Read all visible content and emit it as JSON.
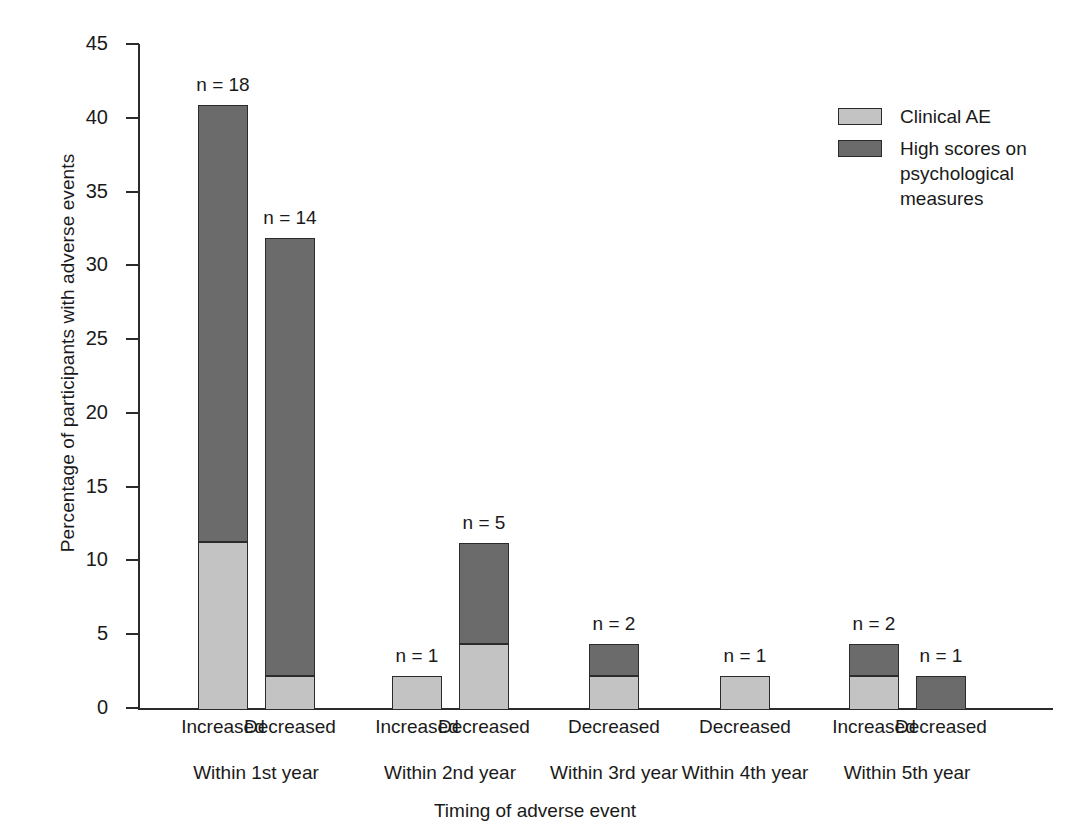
{
  "chart_data": {
    "type": "bar",
    "subtype": "stacked-bar",
    "title": "",
    "xlabel": "Timing of adverse event",
    "ylabel": "Percentage of participants with adverse events",
    "ylim": [
      0,
      45
    ],
    "yticks": [
      0,
      5,
      10,
      15,
      20,
      25,
      30,
      35,
      40,
      45
    ],
    "ytick_labels": [
      "0",
      "5",
      "10",
      "15",
      "20",
      "25",
      "30",
      "35",
      "40",
      "45"
    ],
    "grid": false,
    "legend_position": "top-right",
    "categories": [
      "Increased",
      "Decreased",
      "Increased",
      "Decreased",
      "Decreased",
      "Decreased",
      "Increased",
      "Decreased"
    ],
    "groups": [
      {
        "label": "Within 1st year",
        "categories": [
          "Increased",
          "Decreased"
        ]
      },
      {
        "label": "Within 2nd year",
        "categories": [
          "Increased",
          "Decreased"
        ]
      },
      {
        "label": "Within 3rd year",
        "categories": [
          "Decreased"
        ]
      },
      {
        "label": "Within 4th year",
        "categories": [
          "Decreased"
        ]
      },
      {
        "label": "Within 5th year",
        "categories": [
          "Increased",
          "Decreased"
        ]
      }
    ],
    "series": [
      {
        "name": "Clinical AE",
        "color": "#c3c3c3",
        "values": [
          11.4,
          2.3,
          2.3,
          4.5,
          2.3,
          2.3,
          2.3,
          0
        ]
      },
      {
        "name": "High scores on psychological measures",
        "color": "#6b6b6b",
        "values": [
          29.6,
          29.7,
          0,
          6.8,
          2.2,
          0,
          2.2,
          2.3
        ]
      }
    ],
    "totals": [
      41.0,
      32.0,
      2.3,
      11.3,
      4.5,
      2.3,
      4.5,
      2.3
    ],
    "point_labels": [
      "n = 18",
      "n = 14",
      "n = 1",
      "n = 5",
      "n = 2",
      "n = 1",
      "n = 2",
      "n = 1"
    ],
    "bars": [
      {
        "group": "Within 1st year",
        "category": "Increased",
        "label": "n = 18",
        "light": 11.4,
        "dark": 29.6,
        "total": 41.0
      },
      {
        "group": "Within 1st year",
        "category": "Decreased",
        "label": "n = 14",
        "light": 2.3,
        "dark": 29.7,
        "total": 32.0
      },
      {
        "group": "Within 2nd year",
        "category": "Increased",
        "label": "n = 1",
        "light": 2.3,
        "dark": 0.0,
        "total": 2.3
      },
      {
        "group": "Within 2nd year",
        "category": "Decreased",
        "label": "n = 5",
        "light": 4.5,
        "dark": 6.8,
        "total": 11.3
      },
      {
        "group": "Within 3rd year",
        "category": "Decreased",
        "label": "n = 2",
        "light": 2.3,
        "dark": 2.2,
        "total": 4.5
      },
      {
        "group": "Within 4th year",
        "category": "Decreased",
        "label": "n = 1",
        "light": 2.3,
        "dark": 0.0,
        "total": 2.3
      },
      {
        "group": "Within 5th year",
        "category": "Increased",
        "label": "n = 2",
        "light": 2.3,
        "dark": 2.2,
        "total": 4.5
      },
      {
        "group": "Within 5th year",
        "category": "Decreased",
        "label": "n = 1",
        "light": 0.0,
        "dark": 2.3,
        "total": 2.3
      }
    ],
    "legend": [
      {
        "label": "Clinical AE",
        "color": "#c3c3c3"
      },
      {
        "label": "High scores on psychological measures",
        "color": "#6b6b6b"
      }
    ]
  },
  "layout": {
    "bar_centers_px": [
      223,
      290,
      417,
      484,
      614,
      745,
      874,
      941
    ],
    "bar_width_px": 50,
    "plot_left_px": 138,
    "plot_bottom_px": 708,
    "plot_top_px": 44,
    "group_centers_px": [
      256,
      450,
      614,
      745,
      907
    ]
  },
  "colors": {
    "light": "#c3c3c3",
    "dark": "#6b6b6b",
    "axis": "#2b2b2b",
    "text": "#1a1a1a",
    "background": "#ffffff"
  }
}
